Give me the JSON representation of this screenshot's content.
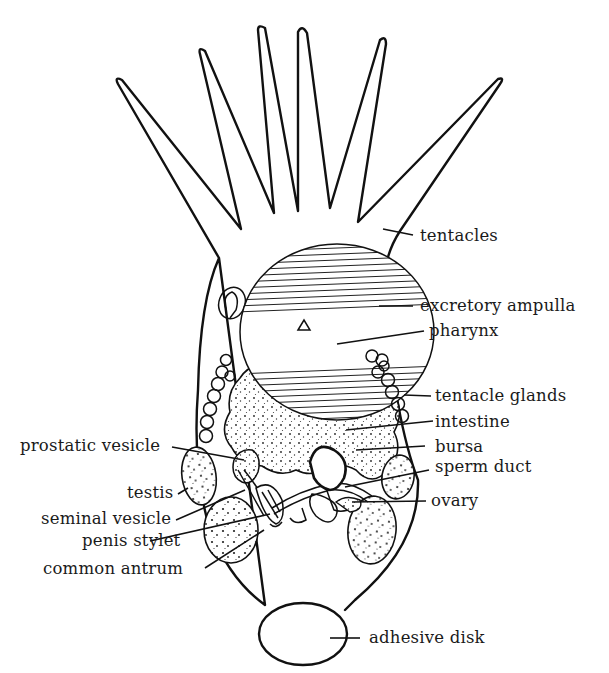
{
  "figure": {
    "labels": {
      "tentacles": "tentacles",
      "excretory_ampulla": "excretory ampulla",
      "pharynx": "pharynx",
      "tentacle_glands": "tentacle glands",
      "intestine": "intestine",
      "bursa": "bursa",
      "sperm_duct": "sperm duct",
      "ovary": "ovary",
      "adhesive_disk": "adhesive disk",
      "prostatic_vesicle": "prostatic vesicle",
      "testis": "testis",
      "seminal_vesicle": "seminal vesicle",
      "penis_stylet": "penis stylet",
      "common_antrum": "common antrum"
    },
    "tentacle_count": 6
  }
}
